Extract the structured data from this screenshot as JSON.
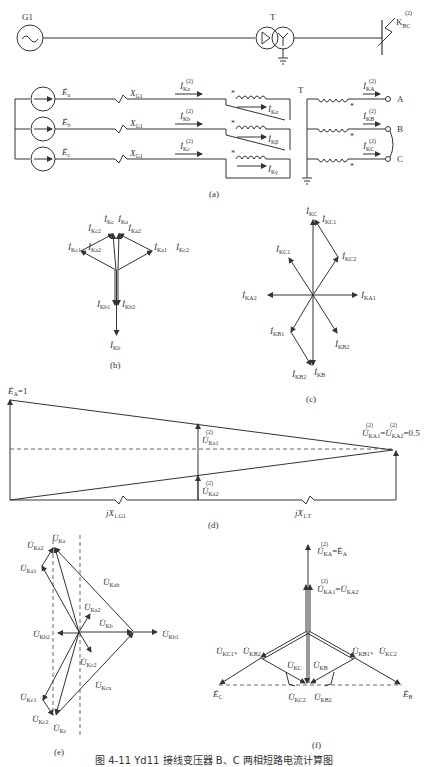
{
  "figure": {
    "top_oneline": {
      "generator_label": "G1",
      "transformer_label": "T",
      "fault_label": "K",
      "fault_sub": "BC",
      "fault_sup": "(2)"
    },
    "panel_a": {
      "sources": [
        "Ė",
        "Ė",
        "Ė"
      ],
      "source_subs": [
        "a",
        "b",
        "c"
      ],
      "reactance_label": "X",
      "reactance_sub": "G1",
      "line_currents": [
        {
          "main": "İ",
          "sub": "Ka",
          "sup": "(2)"
        },
        {
          "main": "İ",
          "sub": "Kb",
          "sup": "(2)"
        },
        {
          "main": "İ",
          "sub": "Kc",
          "sup": "(2)"
        }
      ],
      "winding_currents": [
        {
          "main": "İ",
          "sub": "Kα"
        },
        {
          "main": "İ",
          "sub": "Kβ"
        },
        {
          "main": "İ",
          "sub": "Kγ"
        }
      ],
      "transformer_label": "T",
      "secondary_currents": [
        {
          "main": "İ",
          "sub": "KA",
          "sup": "(2)"
        },
        {
          "main": "İ",
          "sub": "KB",
          "sup": "(2)"
        },
        {
          "main": "İ",
          "sub": "KC",
          "sup": "(2)"
        }
      ],
      "terminals": [
        "A",
        "B",
        "C"
      ],
      "caption": "(a)"
    },
    "panel_b": {
      "labels": [
        {
          "sub": "Kc",
          "sup": "(2)"
        },
        {
          "sub": "Ka",
          "sup": "(2)"
        },
        {
          "sub": "Kc2",
          "sup": "(2)"
        },
        {
          "sub": "Ka2",
          "sup": "(2)"
        },
        {
          "sub": "Kc1",
          "sup": "(2)"
        },
        {
          "sub": "Ka2",
          "sup": "(2)"
        },
        {
          "sub": "Ka1",
          "sup": "(2)"
        },
        {
          "sub": "Kc2",
          "sup": "(2)"
        },
        {
          "sub": "Kb1",
          "sup": "(2)"
        },
        {
          "sub": "Kb2",
          "sup": "(2)"
        },
        {
          "sub": "Kb",
          "sup": "(2)"
        }
      ],
      "caption": "(b)"
    },
    "panel_c": {
      "labels": [
        {
          "sub": "KC",
          "sup": "(2)"
        },
        {
          "sub": "KC1",
          "sup": "(2)"
        },
        {
          "sub": "KC1",
          "sup": "(2)"
        },
        {
          "sub": "KC2",
          "sup": "(2)"
        },
        {
          "sub": "KA2",
          "sup": "(2)"
        },
        {
          "sub": "KA1",
          "sup": "(2)"
        },
        {
          "sub": "KB1",
          "sup": "(2)"
        },
        {
          "sub": "KB2",
          "sup": "(2)"
        },
        {
          "sub": "KB2",
          "sup": "(2)"
        },
        {
          "sub": "KB",
          "sup": "(2)"
        }
      ],
      "caption": "(c)"
    },
    "panel_d": {
      "ea_label": "Ė",
      "ea_sub": "A",
      "ea_value": "=1",
      "u1_label": {
        "sub": "Ka1",
        "sup": "(2)"
      },
      "u2_label": {
        "sub": "Ka2",
        "sup": "(2)"
      },
      "right_label_a": {
        "sub": "KA1",
        "sup": "(2)"
      },
      "right_label_b": {
        "sub": "KA2",
        "sup": "(2)"
      },
      "right_value": "=0.5",
      "x1_label": "jX",
      "x1_sub": "1.G1",
      "x2_label": "jX",
      "x2_sub": "1.T",
      "caption": "(d)"
    },
    "panel_e": {
      "labels": [
        {
          "sub": "Ka",
          "sup": "(2)"
        },
        {
          "sub": "Ka2",
          "sup": "(2)"
        },
        {
          "sub": "Ka1",
          "sup": "(2)"
        },
        {
          "sub": "Kab",
          "sup": "(2)"
        },
        {
          "sub": "Ka2",
          "sup": "(2)"
        },
        {
          "sub": "Kb",
          "sup": "(2)"
        },
        {
          "sub": "Kb2",
          "sup": "(2)"
        },
        {
          "sub": "Kb1",
          "sup": "(2)"
        },
        {
          "sub": "Kc2",
          "sup": "(2)"
        },
        {
          "sub": "Kca",
          "sup": "(2)"
        },
        {
          "sub": "Kc1",
          "sup": "(2)"
        },
        {
          "sub": "Kc2",
          "sup": "(2)"
        },
        {
          "sub": "Kc",
          "sup": "(2)"
        }
      ],
      "caption": "(e)"
    },
    "panel_f": {
      "top_label": {
        "sub": "KA",
        "sup": "(2)",
        "rhs": "=Ė",
        "rhs_sub": "A"
      },
      "mid_label": {
        "sub_a": "KA1",
        "sub_b": "KA2",
        "sup": "(2)",
        "sep": "=U"
      },
      "left_pair": {
        "sub_a": "KC1",
        "sub_b": "KB2",
        "sep": "、"
      },
      "right_pair": {
        "sub_a": "KB1",
        "sub_b": "KC2",
        "sep": "、"
      },
      "kc": {
        "sub": "KC",
        "sup": "(2)"
      },
      "kb": {
        "sub": "KB",
        "sup": "(2)"
      },
      "kc2": {
        "sub": "KC2",
        "sup": "(2)"
      },
      "kb2": {
        "sub": "KB2",
        "sup": "(2)"
      },
      "ec": {
        "main": "Ė",
        "sub": "C"
      },
      "eb": {
        "main": "Ė",
        "sub": "B"
      },
      "caption": "(f)"
    },
    "caption": "图 4-11  Yd11 接线变压器 B、C 两相短路电流计算图"
  }
}
